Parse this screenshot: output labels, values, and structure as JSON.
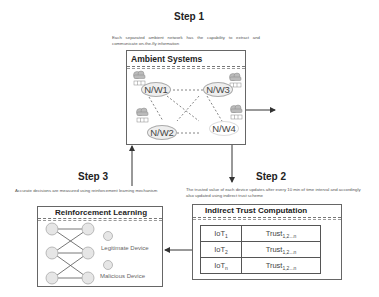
{
  "step1": {
    "title": "Step 1",
    "description": "Each separated ambient network has the capability to extract and communicate on-the-fly information",
    "box_title": "Ambient Systems",
    "nodes": [
      "N/W1",
      "N/W3",
      "N/W2",
      "N/W4"
    ]
  },
  "step2": {
    "title": "Step 2",
    "description": "The trusted value of each device updates after every 10 min of time interval and accordingly also updated using indirect trust scheme",
    "box_title": "Indirect Trust Computation",
    "rows": [
      {
        "device": "IoT",
        "device_sub": "1",
        "trust": "Trust",
        "trust_sub": "1,2...n"
      },
      {
        "device": "IoT",
        "device_sub": "2",
        "trust": "Trust",
        "trust_sub": "1,2...n"
      },
      {
        "device": "IoT",
        "device_sub": "n",
        "trust": "Trust",
        "trust_sub": "1,2...n"
      }
    ]
  },
  "step3": {
    "title": "Step 3",
    "description": "Accurate decisions are measured using reinforcement learning mechanism",
    "box_title": "Reinforcement Learning",
    "legend": {
      "legitimate": "Legitimate Device",
      "malicious": "Malicious Device"
    }
  },
  "colors": {
    "border": "#666666",
    "node_fill": "#eeeeee",
    "arrow": "#333333"
  }
}
